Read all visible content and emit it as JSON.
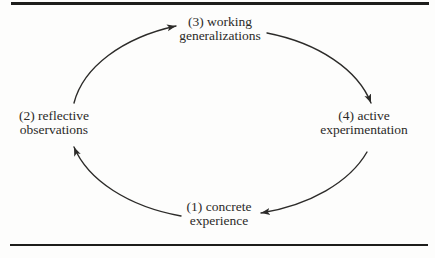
{
  "diagram": {
    "type": "cycle",
    "colors": {
      "background": "#fdfdfc",
      "text": "#2b2a28",
      "line": "#2c2b29",
      "rule": "#1d1d1b"
    },
    "nodes": [
      {
        "id": "concrete-experience",
        "number": 1,
        "lines": [
          "(1) concrete",
          "experience"
        ]
      },
      {
        "id": "reflective-observations",
        "number": 2,
        "lines": [
          "(2) reflective",
          "observations"
        ]
      },
      {
        "id": "working-generalizations",
        "number": 3,
        "lines": [
          "(3) working",
          "generalizations"
        ]
      },
      {
        "id": "active-experimentation",
        "number": 4,
        "lines": [
          "(4) active",
          "experimentation"
        ]
      }
    ],
    "arrows": [
      {
        "from": "concrete-experience",
        "to": "reflective-observations"
      },
      {
        "from": "reflective-observations",
        "to": "working-generalizations"
      },
      {
        "from": "working-generalizations",
        "to": "active-experimentation"
      },
      {
        "from": "active-experimentation",
        "to": "concrete-experience"
      }
    ]
  }
}
